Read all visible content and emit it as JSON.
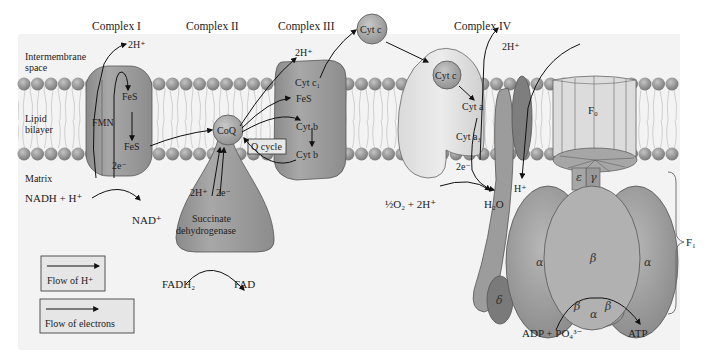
{
  "complexes": {
    "c1": "Complex I",
    "c2": "Complex II",
    "c3": "Complex III",
    "c4": "Complex IV"
  },
  "regions": {
    "intermembrane_1": "Intermembrane",
    "intermembrane_2": "space",
    "lipid_1": "Lipid",
    "lipid_2": "bilayer",
    "matrix": "Matrix"
  },
  "complex1": {
    "proton": "2H⁺",
    "fes_top": "FeS",
    "fmn": "FMN",
    "fes_bottom": "FeS",
    "electrons": "2e⁻",
    "substrate": "NADH + H⁺",
    "product": "NAD⁺"
  },
  "complex2": {
    "coq": "CoQ",
    "proton": "2H⁺",
    "electrons": "2e⁻",
    "name_1": "Succinate",
    "name_2": "dehydrogenase",
    "substrate": "FADH₂",
    "product": "FAD"
  },
  "complex3": {
    "proton": "2H⁺",
    "cyt_c1": "Cyt c₁",
    "fes": "FeS",
    "cyt_b1": "Cyt b",
    "cyt_b2": "Cyt b",
    "q_cycle": "Q cycle",
    "cyt_c_mobile": "Cyt c"
  },
  "complex4": {
    "proton": "2H⁺",
    "cyt_c": "Cyt c",
    "cyt_a": "Cyt a",
    "cyt_a3": "Cyt a₃",
    "electrons": "2e⁻",
    "substrate": "½O₂ + 2H⁺",
    "product": "H₂O"
  },
  "atp_synthase": {
    "f0": "F₀",
    "f1": "F₁",
    "proton_in": "H⁺",
    "epsilon": "ε",
    "gamma": "γ",
    "delta": "δ",
    "alpha_left": "α",
    "alpha_right": "α",
    "alpha_bottom": "α",
    "beta_center": "β",
    "beta_bottom_left": "β",
    "beta_bottom_right": "β",
    "substrate": "ADP + PO₄³⁻",
    "product": "ATP"
  },
  "legend": {
    "proton_flow": "Flow of H⁺",
    "electron_flow": "Flow of electrons"
  },
  "colors": {
    "protein_dark": "#8f8f8f",
    "protein_mid": "#a9a9a9",
    "protein_light": "#d4d4d4",
    "lipid_head": "#9a9a9a",
    "background": "#f4f4f4"
  }
}
